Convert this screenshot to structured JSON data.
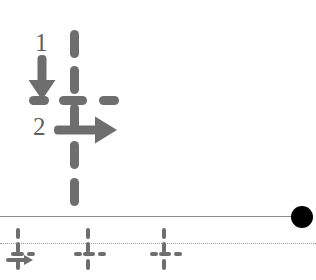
{
  "figure": {
    "background_color": "#ffffff",
    "marker_color": "#6e6e6e",
    "label_color": "#5f5f5f",
    "line_color": "#8d8d8d",
    "guide_color": "#9a9a9a",
    "dot_color": "#000000"
  },
  "steps": [
    {
      "id": "1",
      "label": "1",
      "direction": "down"
    },
    {
      "id": "2",
      "label": "2",
      "direction": "right"
    }
  ],
  "icons": {
    "arrow_down": "arrow-down-icon",
    "arrow_right": "arrow-right-icon",
    "crosshair": "crosshair-icon",
    "dot": "filled-circle-icon"
  },
  "main_crosshair": {
    "name": "crosshair-main",
    "center_x": 74,
    "center_y": 100,
    "vertical_dashes": [
      {
        "x": 70,
        "y": 30,
        "h": 28
      },
      {
        "x": 70,
        "y": 66,
        "h": 28
      },
      {
        "x": 70,
        "y": 103,
        "h": 28
      },
      {
        "x": 70,
        "y": 140,
        "h": 28
      },
      {
        "x": 70,
        "y": 177,
        "h": 28
      }
    ],
    "horizontal_dashes": [
      {
        "x": 29,
        "y": 96,
        "w": 20
      },
      {
        "x": 60,
        "y": 96,
        "w": 26
      },
      {
        "x": 98,
        "y": 96,
        "w": 20
      }
    ]
  },
  "small_crosshairs": [
    {
      "name": "crosshair-small-1",
      "x": 4,
      "y": 228,
      "has_arrow": true
    },
    {
      "name": "crosshair-small-2",
      "x": 74,
      "y": 228,
      "has_arrow": false
    },
    {
      "name": "crosshair-small-3",
      "x": 150,
      "y": 228,
      "has_arrow": false
    }
  ],
  "ground_line": {
    "name": "ground-line",
    "x": 0,
    "y": 216,
    "width": 295
  },
  "guide_line": {
    "name": "guide-line",
    "x": 0,
    "y": 243,
    "width": 316,
    "style": "dotted"
  },
  "end_dot": {
    "name": "end-dot",
    "x": 291,
    "y": 206,
    "diameter": 22
  }
}
